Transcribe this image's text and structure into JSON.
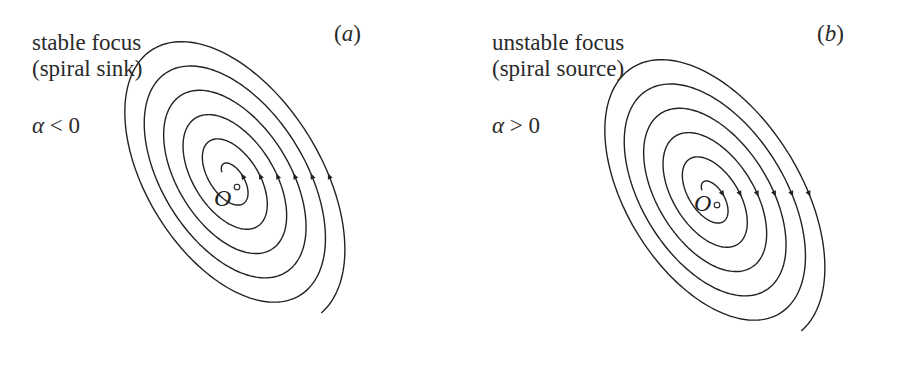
{
  "panels": [
    {
      "id": "a",
      "tag": "(a)",
      "tag_letter": "a",
      "title_line1": "stable focus",
      "title_line2": "(spiral sink)",
      "condition_symbol": "α",
      "condition_rel": " < 0",
      "origin_label": "O",
      "stability": "stable",
      "arrow_direction": "inward",
      "geometry": {
        "cx": 230,
        "cy": 178,
        "tilt_deg": -32,
        "a0": 12,
        "b0": 6,
        "growth_a": 27,
        "growth_b": 15.5,
        "turns": 5.6
      }
    },
    {
      "id": "b",
      "tag": "(b)",
      "tag_letter": "b",
      "title_line1": "unstable focus",
      "title_line2": "(spiral source)",
      "condition_symbol": "α",
      "condition_rel": " > 0",
      "origin_label": "O",
      "stability": "unstable",
      "arrow_direction": "outward",
      "geometry": {
        "cx": 250,
        "cy": 196,
        "tilt_deg": -32,
        "a0": 12,
        "b0": 6,
        "growth_a": 27,
        "growth_b": 15.5,
        "turns": 5.6
      }
    }
  ],
  "colors": {
    "stroke": "#222222",
    "background": "#ffffff"
  }
}
